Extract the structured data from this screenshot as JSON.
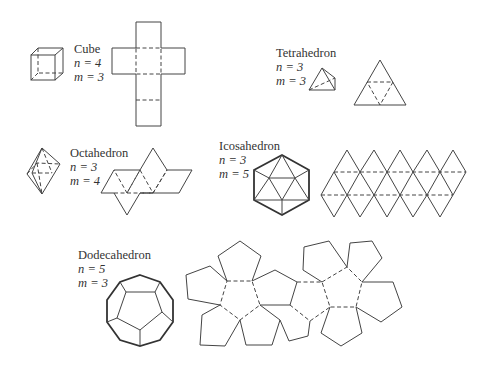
{
  "solids": [
    {
      "name": "Cube",
      "n_label": "n = 4",
      "m_label": "m = 3"
    },
    {
      "name": "Tetrahedron",
      "n_label": "n = 3",
      "m_label": "m = 3"
    },
    {
      "name": "Octahedron",
      "n_label": "n = 3",
      "m_label": "m = 4"
    },
    {
      "name": "Icosahedron",
      "n_label": "n = 3",
      "m_label": "m = 5"
    },
    {
      "name": "Dodecahedron",
      "n_label": "n = 5",
      "m_label": "m = 3"
    }
  ],
  "colors": {
    "line": "#444444",
    "text": "#333333",
    "background": "#ffffff"
  }
}
